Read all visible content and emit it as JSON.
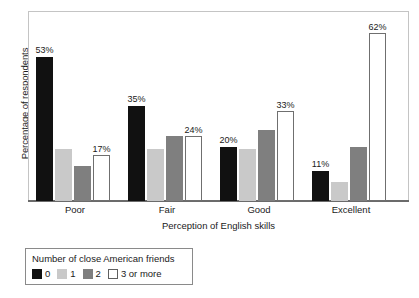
{
  "chart_data": {
    "type": "bar",
    "title": "",
    "xlabel": "Perception of English skills",
    "ylabel": "Percentage of respondents",
    "categories": [
      "Poor",
      "Fair",
      "Good",
      "Excellent"
    ],
    "ylim": [
      0,
      70
    ],
    "grid": false,
    "legend_position": "below-left",
    "legend_title": "Number of close American friends",
    "series": [
      {
        "name": "0",
        "color": "#111111",
        "values": [
          53,
          35,
          20,
          11
        ],
        "labels": [
          "53%",
          "35%",
          "20%",
          "11%"
        ]
      },
      {
        "name": "1",
        "color": "#c9c9c9",
        "values": [
          19,
          19,
          19,
          7
        ],
        "labels": [
          "",
          "",
          "",
          ""
        ]
      },
      {
        "name": "2",
        "color": "#7f7f7f",
        "values": [
          13,
          24,
          26,
          20
        ],
        "labels": [
          "",
          "",
          "",
          ""
        ]
      },
      {
        "name": "3 or more",
        "color": "#ffffff",
        "values": [
          17,
          24,
          33,
          62
        ],
        "labels": [
          "17%",
          "24%",
          "33%",
          "62%"
        ]
      }
    ]
  },
  "axes": {
    "y_title": "Percentage of respondents",
    "x_title": "Perception of English skills",
    "tick_labels": [
      "Poor",
      "Fair",
      "Good",
      "Excellent"
    ]
  },
  "legend": {
    "title": "Number of close American friends",
    "entries": [
      {
        "label": "0"
      },
      {
        "label": "1"
      },
      {
        "label": "2"
      },
      {
        "label": "3 or more"
      }
    ]
  }
}
